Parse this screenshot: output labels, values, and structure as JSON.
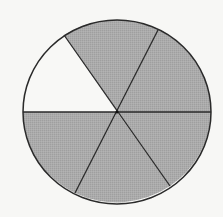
{
  "diagram": {
    "type": "fraction-circle",
    "total_parts": 6,
    "shaded_parts": 5,
    "unshaded_parts": 1,
    "fraction_shaded": "5/6",
    "colors": {
      "background": "#f7f7f5",
      "shaded_fill": "#a9a9a9",
      "unshaded_fill": "#f8f8f6",
      "stroke": "#2a2a2a"
    },
    "sectors": [
      {
        "index": 0,
        "position": "upper-left",
        "shaded": false
      },
      {
        "index": 1,
        "position": "top",
        "shaded": true
      },
      {
        "index": 2,
        "position": "upper-right",
        "shaded": true
      },
      {
        "index": 3,
        "position": "lower-right",
        "shaded": true
      },
      {
        "index": 4,
        "position": "bottom",
        "shaded": true
      },
      {
        "index": 5,
        "position": "lower-left",
        "shaded": true
      }
    ]
  }
}
